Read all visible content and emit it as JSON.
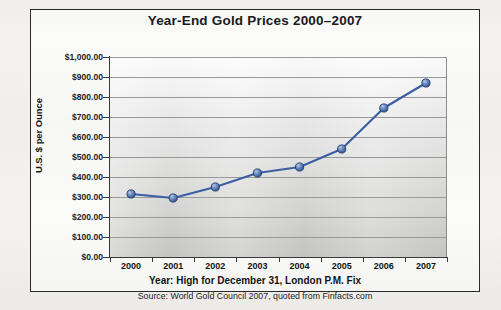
{
  "chart_data": {
    "type": "line",
    "title": "Year-End Gold Prices 2000–2007",
    "xlabel": "Year: High for December 31, London P.M. Fix",
    "ylabel": "U.S. $ per Ounce",
    "source": "Source: World Gold Council 2007, quoted from Finfacts.com",
    "categories": [
      "2000",
      "2001",
      "2002",
      "2003",
      "2004",
      "2005",
      "2006",
      "2007"
    ],
    "values": [
      315,
      295,
      350,
      420,
      450,
      540,
      745,
      870
    ],
    "series": [
      {
        "name": "U.S. $ per Ounce",
        "values": [
          315,
          295,
          350,
          420,
          450,
          540,
          745,
          870
        ]
      }
    ],
    "ylim": [
      0,
      1000
    ],
    "ytick_values": [
      0,
      100,
      200,
      300,
      400,
      500,
      600,
      700,
      800,
      900,
      1000
    ],
    "ytick_labels": [
      "$1,000.00",
      "$900.00",
      "$800.00",
      "$700.00",
      "$600.00",
      "$500.00",
      "$400.00",
      "$300.00",
      "$200.00",
      "$100.00",
      "$0.00"
    ],
    "grid": true,
    "legend": false,
    "legend_position": "none",
    "line_color": "#3b5fa4",
    "marker_color": "#4f74b8",
    "marker_edge_color": "#26406f",
    "plot_background": "#dededd",
    "frame_color": "#2b2b2b"
  }
}
